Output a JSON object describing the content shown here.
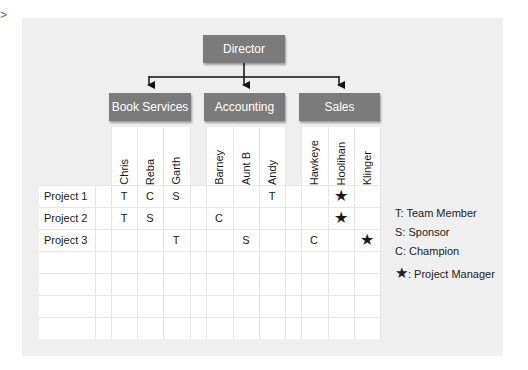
{
  "caret": ">",
  "org_chart": {
    "root": "Director",
    "departments": [
      "Book Services",
      "Accounting",
      "Sales"
    ]
  },
  "columns": [
    {
      "name": "Chris",
      "department": "Book Services"
    },
    {
      "name": "Reba",
      "department": "Book Services"
    },
    {
      "name": "Garth",
      "department": "Book Services"
    },
    {
      "name": "Barney",
      "department": "Accounting"
    },
    {
      "name": "Aunt B",
      "department": "Accounting"
    },
    {
      "name": "Andy",
      "department": "Accounting"
    },
    {
      "name": "Hawkeye",
      "department": "Sales"
    },
    {
      "name": "Hoolihan",
      "department": "Sales"
    },
    {
      "name": "Klinger",
      "department": "Sales"
    }
  ],
  "rows": [
    {
      "label": "Project 1",
      "cells": [
        "T",
        "C",
        "S",
        "",
        "",
        "T",
        "",
        "★",
        ""
      ]
    },
    {
      "label": "Project 2",
      "cells": [
        "T",
        "S",
        "",
        "C",
        "",
        "",
        "",
        "★",
        ""
      ]
    },
    {
      "label": "Project 3",
      "cells": [
        "",
        "",
        "T",
        "",
        "S",
        "",
        "C",
        "",
        "★"
      ]
    },
    {
      "label": "",
      "cells": [
        "",
        "",
        "",
        "",
        "",
        "",
        "",
        "",
        ""
      ]
    },
    {
      "label": "",
      "cells": [
        "",
        "",
        "",
        "",
        "",
        "",
        "",
        "",
        ""
      ]
    },
    {
      "label": "",
      "cells": [
        "",
        "",
        "",
        "",
        "",
        "",
        "",
        "",
        ""
      ]
    },
    {
      "label": "",
      "cells": [
        "",
        "",
        "",
        "",
        "",
        "",
        "",
        "",
        ""
      ]
    }
  ],
  "legend": [
    {
      "key": "T",
      "text": "T: Team Member"
    },
    {
      "key": "S",
      "text": "S: Sponsor"
    },
    {
      "key": "C",
      "text": "C: Champion"
    },
    {
      "key": "star-icon",
      "symbol": "★",
      "text": ": Project Manager"
    }
  ],
  "colors": {
    "box_fill": "#7b7b7b",
    "panel_bg": "#efefef",
    "grid_line": "#e6e6e6"
  }
}
